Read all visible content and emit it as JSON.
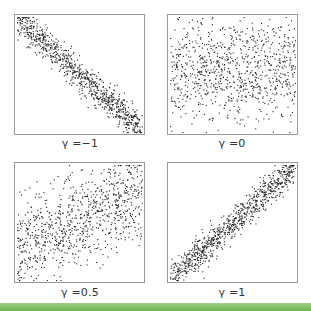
{
  "chart_data": [
    {
      "type": "scatter",
      "title": "γ = −1",
      "label": "γ =−1",
      "correlation": -1,
      "trend": "strong negative linear",
      "points_approx": 900,
      "xlim": [
        0,
        1
      ],
      "ylim": [
        0,
        1
      ],
      "axes_ticks": false,
      "grid": false
    },
    {
      "type": "scatter",
      "title": "γ = 0",
      "label": "γ =0",
      "correlation": 0,
      "trend": "no correlation, uniform cloud denser in middle band",
      "points_approx": 900,
      "xlim": [
        0,
        1
      ],
      "ylim": [
        0,
        1
      ],
      "axes_ticks": false,
      "grid": false
    },
    {
      "type": "scatter",
      "title": "γ = 0.5",
      "label": "γ =0.5",
      "correlation": 0.5,
      "trend": "moderate positive, wide spread",
      "points_approx": 900,
      "xlim": [
        0,
        1
      ],
      "ylim": [
        0,
        1
      ],
      "axes_ticks": false,
      "grid": false
    },
    {
      "type": "scatter",
      "title": "γ = 1",
      "label": "γ =1",
      "correlation": 1,
      "trend": "strong positive linear",
      "points_approx": 900,
      "xlim": [
        0,
        1
      ],
      "ylim": [
        0,
        1
      ],
      "axes_ticks": false,
      "grid": false
    }
  ],
  "labels": {
    "tl": "γ =−1",
    "tr": "γ =0",
    "bl": "γ =0.5",
    "br": "γ =1"
  },
  "colors": {
    "point": "#222222",
    "frame": "#9a9a9a",
    "band": "#7cbf62"
  }
}
